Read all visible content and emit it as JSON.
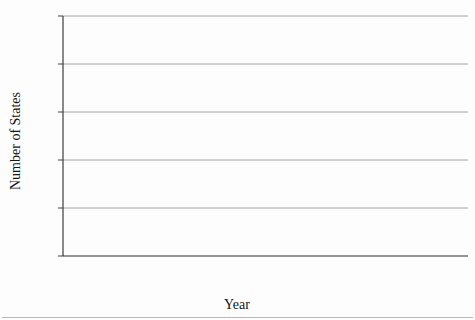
{
  "chart_data": {
    "type": "line",
    "title": "",
    "xlabel": "Year",
    "ylabel": "Number of States",
    "xlim": [
      78,
      99.4
    ],
    "ylim": [
      0,
      25
    ],
    "grid": true,
    "legend_position": "upper-left",
    "x_ticks_major": [
      78,
      83,
      88,
      93,
      98
    ],
    "x_tick_labels": [
      "78",
      "83",
      "88",
      "93",
      "98"
    ],
    "y_ticks": [
      0,
      5,
      10,
      15,
      20,
      25
    ],
    "y_tick_labels": [
      "0",
      "5",
      "10",
      "15",
      "20",
      "25"
    ],
    "x": [
      78,
      79,
      80,
      81,
      82,
      83,
      84,
      85,
      86,
      87,
      88,
      89,
      90,
      91,
      92,
      93,
      94,
      95,
      96,
      97,
      98,
      99
    ],
    "series": [
      {
        "name": "\"because of\"",
        "marker": "filled-diamond",
        "values": [
          1,
          1,
          1,
          1,
          3,
          3,
          3,
          3,
          4,
          5,
          8,
          11,
          11,
          12,
          12,
          12,
          15,
          17,
          17,
          19,
          20,
          20
        ]
      },
      {
        "name": "\"intent to intimidate or harass\"",
        "marker": "open-square",
        "values": [
          0,
          0,
          0,
          0,
          1,
          4,
          4,
          4,
          4,
          6,
          7,
          10,
          11,
          12,
          12,
          12,
          12,
          12,
          12,
          12,
          12,
          12
        ]
      },
      {
        "name": "\"maliciously and with specific intent to harass\"",
        "marker": "open-triangle",
        "values": [
          0,
          0,
          0,
          0,
          1,
          2,
          2,
          2,
          2,
          3,
          4,
          4,
          5,
          5,
          5,
          6,
          6,
          6,
          6,
          6,
          6,
          6
        ]
      },
      {
        "name": "\"prejudice, hostility, maliciousness\"",
        "marker": "cross-x",
        "values": [
          0,
          0,
          0,
          0,
          1,
          1,
          1,
          1,
          1,
          1,
          1,
          3,
          4,
          4,
          5,
          5,
          5,
          5,
          5,
          5,
          5,
          5
        ]
      }
    ]
  },
  "legend": {
    "entries": [
      {
        "label": "\"because of\"",
        "marker": "filled-diamond"
      },
      {
        "label": "\"intent to intimidate or harass\"",
        "marker": "open-square"
      },
      {
        "label": "\"maliciously and with specific intent to harass\"",
        "marker": "open-triangle"
      },
      {
        "label": "\"prejudice, hostility, maliciousness\"",
        "marker": "cross-x"
      }
    ]
  },
  "colors": {
    "line": "#3c3c3c",
    "marker_fill": "#151515",
    "marker_open": "#ffffff",
    "axis": "#2b2b2b",
    "grid": "#8d8d8d",
    "background": "#fdfdfd"
  }
}
